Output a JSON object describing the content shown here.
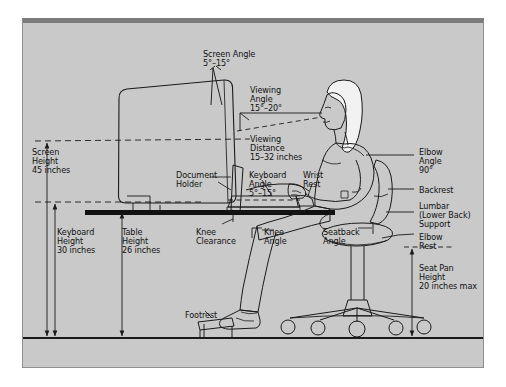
{
  "diagram": {
    "frame": {
      "background_color": "#c9c9c9",
      "border_color": "#8f8f8f",
      "top_band_color": "#7c7c7c",
      "page_color": "#ffffff"
    },
    "line_color": "#1a1a1a",
    "labels": [
      {
        "id": "screen-angle",
        "text": "Screen Angle\n5°–15°",
        "x": 203,
        "y": 50,
        "align": "left"
      },
      {
        "id": "viewing-angle",
        "text": "Viewing\nAngle\n15°–20°",
        "x": 250,
        "y": 86,
        "align": "left"
      },
      {
        "id": "viewing-distance",
        "text": "Viewing\nDistance\n15–32 inches",
        "x": 250,
        "y": 135,
        "align": "left"
      },
      {
        "id": "screen-height",
        "text": "Screen\nHeight\n45 inches",
        "x": 32,
        "y": 148,
        "align": "left"
      },
      {
        "id": "document-holder",
        "text": "Document\nHolder",
        "x": 176,
        "y": 171,
        "align": "left"
      },
      {
        "id": "keyboard-angle",
        "text": "Keyboard\nAngle\n5°–15°",
        "x": 249,
        "y": 171,
        "align": "left"
      },
      {
        "id": "wrist-rest",
        "text": "Wrist\nRest",
        "x": 303,
        "y": 171,
        "align": "left"
      },
      {
        "id": "elbow-angle",
        "text": "Elbow\nAngle\n90°",
        "x": 419,
        "y": 148,
        "align": "left"
      },
      {
        "id": "backrest",
        "text": "Backrest",
        "x": 419,
        "y": 186,
        "align": "left"
      },
      {
        "id": "lumbar-support",
        "text": "Lumbar\n(Lower Back)\nSupport",
        "x": 419,
        "y": 202,
        "align": "left"
      },
      {
        "id": "elbow-rest",
        "text": "Elbow\nRest",
        "x": 419,
        "y": 233,
        "align": "left"
      },
      {
        "id": "seat-pan-height",
        "text": "Seat Pan\nHeight\n20 inches max",
        "x": 419,
        "y": 264,
        "align": "left"
      },
      {
        "id": "keyboard-height",
        "text": "Keyboard\nHeight\n30 inches",
        "x": 57,
        "y": 228,
        "align": "left"
      },
      {
        "id": "table-height",
        "text": "Table\nHeight\n26 inches",
        "x": 122,
        "y": 228,
        "align": "left"
      },
      {
        "id": "knee-clearance",
        "text": "Knee\nClearance",
        "x": 196,
        "y": 228,
        "align": "left"
      },
      {
        "id": "knee-angle",
        "text": "Knee\nAngle",
        "x": 264,
        "y": 228,
        "align": "left"
      },
      {
        "id": "seatback-angle",
        "text": "Seatback\nAngle",
        "x": 323,
        "y": 228,
        "align": "left"
      },
      {
        "id": "footrest",
        "text": "Footrest",
        "x": 185,
        "y": 311,
        "align": "left"
      }
    ],
    "measurements": [
      {
        "name": "screen-height",
        "value": "45 inches"
      },
      {
        "name": "keyboard-height",
        "value": "30 inches"
      },
      {
        "name": "table-height",
        "value": "26 inches"
      },
      {
        "name": "seat-pan-height",
        "value": "20 inches max"
      },
      {
        "name": "viewing-distance",
        "value": "15–32 inches"
      },
      {
        "name": "screen-angle",
        "value": "5°–15°"
      },
      {
        "name": "viewing-angle",
        "value": "15°–20°"
      },
      {
        "name": "keyboard-angle",
        "value": "5°–15°"
      },
      {
        "name": "elbow-angle",
        "value": "90°"
      }
    ],
    "objects": [
      "monitor",
      "document-holder",
      "desk",
      "keyboard",
      "wrist-rest",
      "office-chair",
      "chair-casters",
      "footrest",
      "seated-person"
    ]
  }
}
